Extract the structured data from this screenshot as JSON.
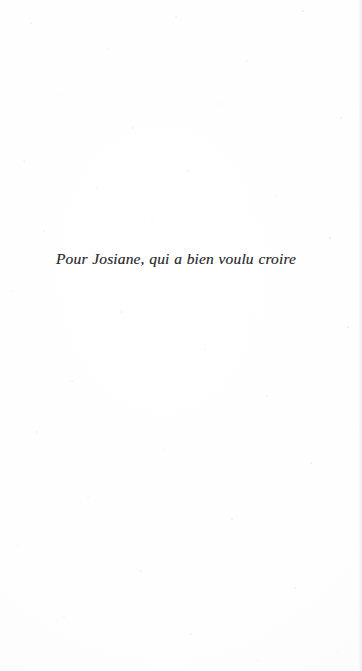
{
  "page": {
    "kind": "book-dedication-page",
    "background_color": "#fefefe",
    "text_color": "#2e2e30"
  },
  "dedication": {
    "text": "Pour Josiane, qui a bien voulu croire"
  }
}
